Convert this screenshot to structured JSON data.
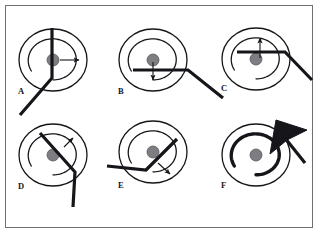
{
  "figure": {
    "type": "scientific-figure",
    "title": "",
    "border_color": "#6f6f74",
    "background_color": "#ffffff",
    "ink_color": "#15151a",
    "nucleus_color": "#7d7d82",
    "panel_count": 6,
    "columns": 3,
    "rows": 2
  },
  "panels": [
    {
      "id": "A",
      "label": "A",
      "label_x": 18,
      "label_y": 94,
      "cx": 53,
      "cy": 60,
      "outer_rx": 34,
      "outer_ry": 31,
      "inner_rx": 25,
      "inner_ry": 22,
      "nucleus_r": 6,
      "spiral_open_deg": 25,
      "spiral_bold": false,
      "needle": {
        "description": "vertical-line-through-center-bending-down-left",
        "points": "52,28 52,78 20,115"
      },
      "arrow": {
        "description": "short-arrow-pointing-right-from-nucleus",
        "x1": 60,
        "y1": 60,
        "x2": 79,
        "y2": 60
      }
    },
    {
      "id": "B",
      "label": "B",
      "label_x": 118,
      "label_y": 94,
      "cx": 153,
      "cy": 60,
      "outer_rx": 34,
      "outer_ry": 31,
      "inner_rx": 25,
      "inner_ry": 22,
      "nucleus_r": 6,
      "spiral_open_deg": 25,
      "spiral_bold": false,
      "needle": {
        "description": "horizontal-line-below-center-bending-down-right",
        "points": "133,70 188,70 223,98"
      },
      "arrow": {
        "description": "short-arrow-pointing-down-from-nucleus",
        "x1": 153,
        "y1": 62,
        "x2": 153,
        "y2": 80
      }
    },
    {
      "id": "C",
      "label": "C",
      "label_x": 221,
      "label_y": 91,
      "cx": 256,
      "cy": 59,
      "outer_rx": 34,
      "outer_ry": 31,
      "inner_rx": 25,
      "inner_ry": 22,
      "nucleus_r": 6,
      "spiral_open_deg": 25,
      "spiral_bold": false,
      "needle": {
        "description": "horizontal-line-above-center-bending-down-right",
        "points": "237,52 285,52 312,80"
      },
      "arrow": {
        "description": "short-arrow-pointing-up-from-nucleus",
        "x1": 260,
        "y1": 58,
        "x2": 260,
        "y2": 38
      }
    },
    {
      "id": "D",
      "label": "D",
      "label_x": 18,
      "label_y": 189,
      "cx": 53,
      "cy": 155,
      "outer_rx": 34,
      "outer_ry": 31,
      "inner_rx": 25,
      "inner_ry": 22,
      "nucleus_r": 6,
      "spiral_open_deg": 25,
      "spiral_bold": false,
      "needle": {
        "description": "diagonal-line-from-upper-left-bending-down",
        "points": "40,133 75,172 73,207"
      },
      "arrow": {
        "description": "short-arrow-pointing-up-right",
        "x1": 64,
        "y1": 147,
        "x2": 73,
        "y2": 138
      }
    },
    {
      "id": "E",
      "label": "E",
      "label_x": 118,
      "label_y": 188,
      "cx": 153,
      "cy": 152,
      "outer_rx": 34,
      "outer_ry": 31,
      "inner_rx": 25,
      "inner_ry": 22,
      "nucleus_r": 6,
      "spiral_open_deg": 25,
      "spiral_bold": false,
      "needle": {
        "description": "line-from-upper-right-to-vertex-then-horizontal-left",
        "points": "177,139 146,170 107,166"
      },
      "arrow": {
        "description": "short-arrow-pointing-down-right",
        "x1": 158,
        "y1": 163,
        "x2": 170,
        "y2": 174
      }
    },
    {
      "id": "F",
      "label": "F",
      "label_x": 221,
      "label_y": 188,
      "cx": 256,
      "cy": 155,
      "outer_rx": 34,
      "outer_ry": 31,
      "inner_rx": 25,
      "inner_ry": 22,
      "nucleus_r": 6,
      "spiral_open_deg": 25,
      "spiral_bold": true,
      "needle": null,
      "arrow": null,
      "cursor": {
        "description": "large-filled-black-arrowhead-pointing-down-left",
        "tip_x": 270,
        "tip_y": 154,
        "tail_x": 305,
        "tail_y": 163
      }
    }
  ]
}
